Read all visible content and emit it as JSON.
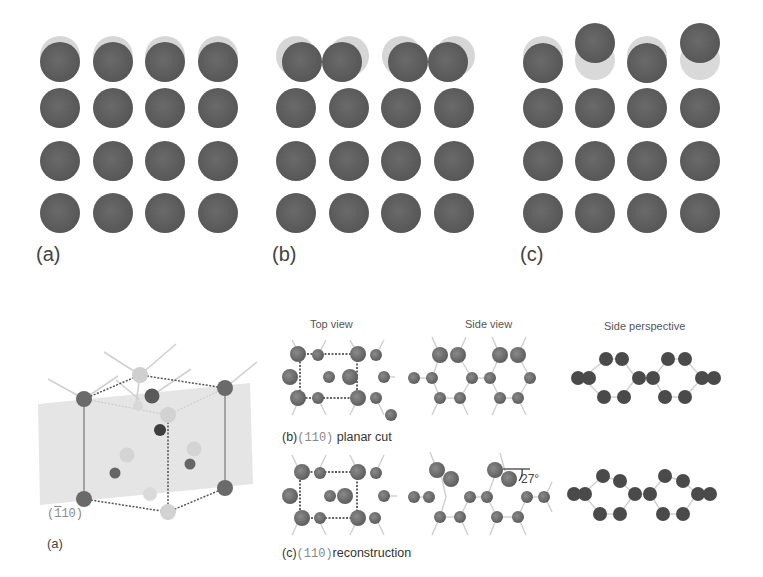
{
  "figure_top": {
    "panels": [
      {
        "label": "(a)",
        "description": "unreconstructed surface, top row slightly shifted",
        "rows": 4,
        "cols": 4
      },
      {
        "label": "(b)",
        "description": "pairing (dimerization) of top row atoms",
        "rows": 4,
        "cols": 4
      },
      {
        "label": "(c)",
        "description": "buckling of top row atoms, alternating up/down",
        "rows": 4,
        "cols": 4
      }
    ],
    "colors": {
      "atom": "#5f5f5f",
      "ghost_atom": "#d4d4d4"
    }
  },
  "figure_bottom": {
    "panel_a": {
      "label": "(a)",
      "plane_label_prefix": "(",
      "plane_label_bar": "1",
      "plane_label_rest": "10)"
    },
    "column_headers": {
      "top_view": "Top view",
      "side_view": "Side view",
      "side_perspective": "Side perspective"
    },
    "row_b": {
      "label_prefix": "(b)",
      "miller": "(110)",
      "label_text": " planar cut"
    },
    "row_c": {
      "label_prefix": "(c)",
      "miller": "(110)",
      "label_text": "reconstruction"
    },
    "angle_annotation": "27°",
    "colors": {
      "atom": "#6a6a6a",
      "bond": "#c8c8c8",
      "plane": "#e4e4e4",
      "dark_atom": "#3e3e3e",
      "light_atom": "#cfcfcf"
    }
  }
}
